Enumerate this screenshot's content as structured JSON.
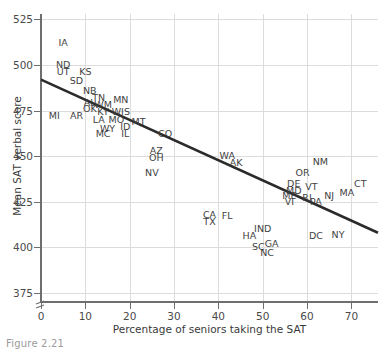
{
  "caption": "Figure 2.21",
  "chart_data": {
    "type": "scatter",
    "title": "",
    "xlabel": "Percentage of seniors taking the SAT",
    "ylabel": "Mean SAT verbal score",
    "xlim": [
      0,
      76
    ],
    "ylim": [
      370,
      528
    ],
    "xticks": [
      0,
      10,
      20,
      30,
      40,
      50,
      60,
      70
    ],
    "yticks": [
      375,
      400,
      425,
      450,
      475,
      500,
      525
    ],
    "grid": true,
    "axis_break_y": true,
    "legend": "none",
    "point_label_mode": "state-abbreviation",
    "trendline": {
      "type": "linear",
      "x": [
        0,
        76
      ],
      "y": [
        492,
        408
      ]
    },
    "points": [
      {
        "label": "IA",
        "x": 5,
        "y": 512
      },
      {
        "label": "ND",
        "x": 5,
        "y": 500
      },
      {
        "label": "UT",
        "x": 5,
        "y": 496
      },
      {
        "label": "KS",
        "x": 10,
        "y": 496
      },
      {
        "label": "SD",
        "x": 8,
        "y": 491
      },
      {
        "label": "NB",
        "x": 11,
        "y": 486
      },
      {
        "label": "TN",
        "x": 13,
        "y": 482
      },
      {
        "label": "MN",
        "x": 18,
        "y": 481
      },
      {
        "label": "AL",
        "x": 11,
        "y": 479
      },
      {
        "label": "WM",
        "x": 14,
        "y": 478
      },
      {
        "label": "OK",
        "x": 11,
        "y": 476
      },
      {
        "label": "KY",
        "x": 14,
        "y": 474
      },
      {
        "label": "WIS",
        "x": 18,
        "y": 474
      },
      {
        "label": "MI",
        "x": 3,
        "y": 472
      },
      {
        "label": "AR",
        "x": 8,
        "y": 472
      },
      {
        "label": "LA",
        "x": 13,
        "y": 470
      },
      {
        "label": "MO",
        "x": 17,
        "y": 470
      },
      {
        "label": "MT",
        "x": 22,
        "y": 469
      },
      {
        "label": "WY",
        "x": 15,
        "y": 465
      },
      {
        "label": "ID",
        "x": 19,
        "y": 466
      },
      {
        "label": "MC",
        "x": 14,
        "y": 462
      },
      {
        "label": "IL",
        "x": 19,
        "y": 462
      },
      {
        "label": "CO",
        "x": 28,
        "y": 462
      },
      {
        "label": "AZ",
        "x": 26,
        "y": 453
      },
      {
        "label": "OH",
        "x": 26,
        "y": 449
      },
      {
        "label": "WA",
        "x": 42,
        "y": 450
      },
      {
        "label": "AK",
        "x": 44,
        "y": 446
      },
      {
        "label": "NV",
        "x": 25,
        "y": 441
      },
      {
        "label": "NM",
        "x": 63,
        "y": 447
      },
      {
        "label": "OR",
        "x": 59,
        "y": 441
      },
      {
        "label": "DE",
        "x": 57,
        "y": 435
      },
      {
        "label": "VT",
        "x": 61,
        "y": 433
      },
      {
        "label": "CT",
        "x": 72,
        "y": 435
      },
      {
        "label": "MD",
        "x": 57,
        "y": 431
      },
      {
        "label": "MA",
        "x": 69,
        "y": 430
      },
      {
        "label": "ME",
        "x": 56,
        "y": 428
      },
      {
        "label": "RI",
        "x": 60,
        "y": 427
      },
      {
        "label": "NJ",
        "x": 65,
        "y": 428
      },
      {
        "label": "VI",
        "x": 56,
        "y": 425
      },
      {
        "label": "PA",
        "x": 62,
        "y": 425
      },
      {
        "label": "CA",
        "x": 38,
        "y": 418
      },
      {
        "label": "FL",
        "x": 42,
        "y": 417
      },
      {
        "label": "TX",
        "x": 38,
        "y": 414
      },
      {
        "label": "IND",
        "x": 50,
        "y": 410
      },
      {
        "label": "HA",
        "x": 47,
        "y": 406
      },
      {
        "label": "DC",
        "x": 62,
        "y": 406
      },
      {
        "label": "NY",
        "x": 67,
        "y": 407
      },
      {
        "label": "GA",
        "x": 52,
        "y": 402
      },
      {
        "label": "SC",
        "x": 49,
        "y": 400
      },
      {
        "label": "NC",
        "x": 51,
        "y": 397
      }
    ]
  }
}
